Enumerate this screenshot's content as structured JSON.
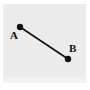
{
  "figure": {
    "name": "line-segment-ab",
    "background_color": "#ffffff",
    "panel_color": "#ececec",
    "ink_color": "#111111"
  },
  "points": [
    {
      "id": "A",
      "label": "A",
      "x": 20,
      "y": 27,
      "radius": 3.2,
      "label_x": 10,
      "label_y": 30
    },
    {
      "id": "B",
      "label": "B",
      "x": 68,
      "y": 59,
      "radius": 3.2,
      "label_x": 69,
      "label_y": 43
    }
  ],
  "segment": {
    "name": "segment-ab",
    "from": "A",
    "to": "B",
    "x1": 20,
    "y1": 27,
    "x2": 68,
    "y2": 59,
    "stroke_width": 1.6,
    "color": "#111111"
  }
}
